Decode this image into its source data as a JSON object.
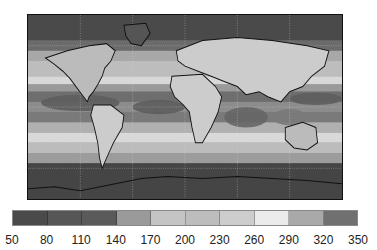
{
  "map": {
    "type": "global-contour-map",
    "projection": "equirectangular",
    "coastlines": true,
    "gridlines": true,
    "bands": [
      {
        "lat_top": 90,
        "lat_bottom": 65,
        "color": "#4a4a4a"
      },
      {
        "lat_top": 65,
        "lat_bottom": 55,
        "color": "#6b6b6b"
      },
      {
        "lat_top": 55,
        "lat_bottom": 45,
        "color": "#a8a8a8"
      },
      {
        "lat_top": 45,
        "lat_bottom": 30,
        "color": "#bdbdbd"
      },
      {
        "lat_top": 30,
        "lat_bottom": 22,
        "color": "#d8d8d8"
      },
      {
        "lat_top": 22,
        "lat_bottom": 15,
        "color": "#9a9a9a"
      },
      {
        "lat_top": 15,
        "lat_bottom": 5,
        "color": "#6e6e6e"
      },
      {
        "lat_top": 5,
        "lat_bottom": -5,
        "color": "#8c8c8c"
      },
      {
        "lat_top": -5,
        "lat_bottom": -15,
        "color": "#7a7a7a"
      },
      {
        "lat_top": -15,
        "lat_bottom": -25,
        "color": "#b0b0b0"
      },
      {
        "lat_top": -25,
        "lat_bottom": -35,
        "color": "#d9d9d9"
      },
      {
        "lat_top": -35,
        "lat_bottom": -45,
        "color": "#bcbcbc"
      },
      {
        "lat_top": -45,
        "lat_bottom": -55,
        "color": "#9c9c9c"
      },
      {
        "lat_top": -55,
        "lat_bottom": -90,
        "color": "#454545"
      }
    ]
  },
  "colorbar": {
    "ticks": [
      "50",
      "80",
      "110",
      "140",
      "170",
      "200",
      "230",
      "260",
      "290",
      "320",
      "350"
    ],
    "colors": [
      "#4a4a4a",
      "#565656",
      "#5a5a5a",
      "#9a9a9a",
      "#c4c4c4",
      "#bdbdbd",
      "#cdcdcd",
      "#ebebeb",
      "#a9a9a9",
      "#707070"
    ]
  },
  "chart_data": {
    "type": "heatmap",
    "title": "",
    "colorbar_min": 50,
    "colorbar_max": 350,
    "colorbar_ticks": [
      50,
      80,
      110,
      140,
      170,
      200,
      230,
      260,
      290,
      320,
      350
    ],
    "xlabel": "",
    "ylabel": ""
  }
}
